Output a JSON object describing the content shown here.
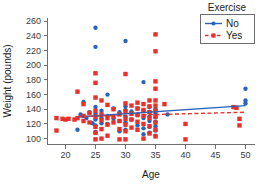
{
  "chart_data": {
    "type": "scatter",
    "title": "",
    "xlabel": "Age",
    "ylabel": "Weight (pounds)",
    "xlim": [
      17,
      51.5
    ],
    "ylim": [
      92,
      265
    ],
    "xticks": [
      20,
      25,
      30,
      35,
      40,
      45,
      50
    ],
    "yticks": [
      100,
      120,
      140,
      160,
      180,
      200,
      220,
      240,
      260
    ],
    "grid": false,
    "legend": {
      "title": "Exercise",
      "position": "top-right",
      "entries": [
        {
          "name": "No",
          "color": "#2a63b8",
          "marker": "circle",
          "linestyle": "solid"
        },
        {
          "name": "Yes",
          "color": "#e8312b",
          "marker": "square",
          "linestyle": "dashed"
        }
      ]
    },
    "series": [
      {
        "name": "No",
        "color": "#2a63b8",
        "marker": "circle",
        "linestyle": "solid",
        "fit_line": {
          "x": [
            22.0,
            50.0
          ],
          "y": [
            129.5,
            145.0
          ]
        },
        "points": [
          [
            22.0,
            112.0
          ],
          [
            22.5,
            133.0
          ],
          [
            23.0,
            150.0
          ],
          [
            23.5,
            128.0
          ],
          [
            24.0,
            136.0
          ],
          [
            24.5,
            121.0
          ],
          [
            25.0,
            251.0
          ],
          [
            25.0,
            225.0
          ],
          [
            25.0,
            143.0
          ],
          [
            25.0,
            134.0
          ],
          [
            25.0,
            126.0
          ],
          [
            25.0,
            118.0
          ],
          [
            25.0,
            109.0
          ],
          [
            26.0,
            138.0
          ],
          [
            26.0,
            128.0
          ],
          [
            26.0,
            121.0
          ],
          [
            27.0,
            160.0
          ],
          [
            27.0,
            131.0
          ],
          [
            27.0,
            120.0
          ],
          [
            28.0,
            141.0
          ],
          [
            28.0,
            127.0
          ],
          [
            29.0,
            136.0
          ],
          [
            29.0,
            124.0
          ],
          [
            29.0,
            110.0
          ],
          [
            30.0,
            233.0
          ],
          [
            30.0,
            144.0
          ],
          [
            30.0,
            139.0
          ],
          [
            30.0,
            130.0
          ],
          [
            30.0,
            122.0
          ],
          [
            30.0,
            112.0
          ],
          [
            31.0,
            137.0
          ],
          [
            31.0,
            126.0
          ],
          [
            32.0,
            141.0
          ],
          [
            32.0,
            133.0
          ],
          [
            32.0,
            118.0
          ],
          [
            33.0,
            177.0
          ],
          [
            33.0,
            138.0
          ],
          [
            33.0,
            128.0
          ],
          [
            33.0,
            114.0
          ],
          [
            33.0,
            106.0
          ],
          [
            34.0,
            143.0
          ],
          [
            34.0,
            136.0
          ],
          [
            34.0,
            130.0
          ],
          [
            34.0,
            124.0
          ],
          [
            34.0,
            116.0
          ],
          [
            34.0,
            108.0
          ],
          [
            35.0,
            140.0
          ],
          [
            35.0,
            134.0
          ],
          [
            35.0,
            129.0
          ],
          [
            35.0,
            123.0
          ],
          [
            35.0,
            117.0
          ],
          [
            35.0,
            111.0
          ],
          [
            35.0,
            104.0
          ],
          [
            37.0,
            133.0
          ],
          [
            50.0,
            168.0
          ],
          [
            50.0,
            152.0
          ],
          [
            50.0,
            148.0
          ]
        ]
      },
      {
        "name": "Yes",
        "color": "#e8312b",
        "marker": "square",
        "linestyle": "dashed",
        "fit_line": {
          "x": [
            22.0,
            50.0
          ],
          "y": [
            130.0,
            136.0
          ]
        },
        "points": [
          [
            18.5,
            128.0
          ],
          [
            18.5,
            111.0
          ],
          [
            19.5,
            127.0
          ],
          [
            20.0,
            126.0
          ],
          [
            20.5,
            127.0
          ],
          [
            21.5,
            126.0
          ],
          [
            22.0,
            164.0
          ],
          [
            22.0,
            128.0
          ],
          [
            23.0,
            147.0
          ],
          [
            23.0,
            131.0
          ],
          [
            23.0,
            124.0
          ],
          [
            24.0,
            135.0
          ],
          [
            24.0,
            122.0
          ],
          [
            25.0,
            189.0
          ],
          [
            25.0,
            176.0
          ],
          [
            25.0,
            156.0
          ],
          [
            25.0,
            138.0
          ],
          [
            25.0,
            130.0
          ],
          [
            25.0,
            116.0
          ],
          [
            25.0,
            108.0
          ],
          [
            25.0,
            99.0
          ],
          [
            26.0,
            152.0
          ],
          [
            26.0,
            133.0
          ],
          [
            26.0,
            125.0
          ],
          [
            26.0,
            113.0
          ],
          [
            26.0,
            100.0
          ],
          [
            27.0,
            146.0
          ],
          [
            27.0,
            128.0
          ],
          [
            27.0,
            119.0
          ],
          [
            27.0,
            104.0
          ],
          [
            28.0,
            140.0
          ],
          [
            28.0,
            130.0
          ],
          [
            28.0,
            122.0
          ],
          [
            29.0,
            133.0
          ],
          [
            29.0,
            124.0
          ],
          [
            29.0,
            113.0
          ],
          [
            29.0,
            99.0
          ],
          [
            30.0,
            188.0
          ],
          [
            30.0,
            148.0
          ],
          [
            30.0,
            137.0
          ],
          [
            30.0,
            127.0
          ],
          [
            30.0,
            119.0
          ],
          [
            30.0,
            110.0
          ],
          [
            30.0,
            99.0
          ],
          [
            31.0,
            145.0
          ],
          [
            31.0,
            134.0
          ],
          [
            31.0,
            126.0
          ],
          [
            31.0,
            115.0
          ],
          [
            32.0,
            149.0
          ],
          [
            32.0,
            141.0
          ],
          [
            32.0,
            132.0
          ],
          [
            32.0,
            123.0
          ],
          [
            32.0,
            112.0
          ],
          [
            33.0,
            147.0
          ],
          [
            33.0,
            139.0
          ],
          [
            33.0,
            131.0
          ],
          [
            33.0,
            120.0
          ],
          [
            33.0,
            100.0
          ],
          [
            34.0,
            152.0
          ],
          [
            34.0,
            144.0
          ],
          [
            34.0,
            136.0
          ],
          [
            34.0,
            128.0
          ],
          [
            34.0,
            117.0
          ],
          [
            34.0,
            107.0
          ],
          [
            35.0,
            242.0
          ],
          [
            35.0,
            219.0
          ],
          [
            35.0,
            178.0
          ],
          [
            35.0,
            168.0
          ],
          [
            35.0,
            152.0
          ],
          [
            35.0,
            145.0
          ],
          [
            35.0,
            138.0
          ],
          [
            35.0,
            130.0
          ],
          [
            35.0,
            122.0
          ],
          [
            35.0,
            112.0
          ],
          [
            35.0,
            103.0
          ],
          [
            36.5,
            147.0
          ],
          [
            40.0,
            120.0
          ],
          [
            40.0,
            99.0
          ],
          [
            48.0,
            143.0
          ],
          [
            48.5,
            142.0
          ],
          [
            49.0,
            127.0
          ],
          [
            49.0,
            118.0
          ]
        ]
      }
    ]
  }
}
